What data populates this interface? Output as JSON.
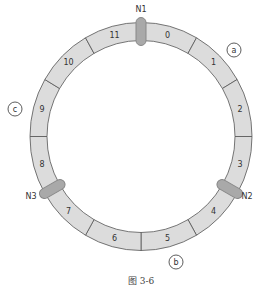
{
  "diagram": {
    "type": "consistent-hash-ring",
    "caption": "图 3-6",
    "center": {
      "x": 141,
      "y": 136.5
    },
    "outer_radius": {
      "rx": 111,
      "ry": 114
    },
    "inner_radius": {
      "rx": 94,
      "ry": 96
    },
    "segment_count": 12,
    "segments": [
      {
        "label": "0"
      },
      {
        "label": "1"
      },
      {
        "label": "2"
      },
      {
        "label": "3"
      },
      {
        "label": "4"
      },
      {
        "label": "5"
      },
      {
        "label": "6"
      },
      {
        "label": "7"
      },
      {
        "label": "8"
      },
      {
        "label": "9"
      },
      {
        "label": "10"
      },
      {
        "label": "11"
      }
    ],
    "nodes": [
      {
        "label": "N1",
        "angle_deg": 0,
        "label_x": 141,
        "label_y": 12
      },
      {
        "label": "N2",
        "angle_deg": 120,
        "label_x": 247,
        "label_y": 199
      },
      {
        "label": "N3",
        "angle_deg": 240,
        "label_x": 31,
        "label_y": 199
      }
    ],
    "callouts": [
      {
        "label": "a",
        "x": 234,
        "y": 50
      },
      {
        "label": "b",
        "x": 176,
        "y": 262
      },
      {
        "label": "c",
        "x": 15,
        "y": 109
      }
    ],
    "colors": {
      "segment_fill": "#dcdcdc",
      "segment_stroke": "#555555",
      "node_fill": "#a9a9a9",
      "node_stroke": "#888888",
      "callout_stroke": "#333333",
      "text": "#333333"
    }
  }
}
